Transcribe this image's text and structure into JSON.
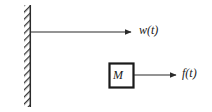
{
  "diagram": {
    "type": "mechanical-free-body-diagram",
    "background_color": "#ffffff",
    "line_color": "#2b2b2b",
    "hatch_color": "#3a3a3a",
    "wall": {
      "name": "fixed-support-wall",
      "hatch_pattern": "diagonal",
      "x": 24,
      "y": 5,
      "width": 6,
      "height": 102
    },
    "displacement_arrow": {
      "label": "w(t)",
      "from_x": 27,
      "to_x": 133,
      "y": 32
    },
    "mass_block": {
      "label": "M",
      "x": 109,
      "y": 63,
      "width": 25,
      "height": 25,
      "border_color": "#1a1a1a",
      "fill_color": "#ffffff"
    },
    "force_arrow": {
      "label": "f(t)",
      "from_x": 134,
      "to_x": 178,
      "y": 75
    }
  }
}
